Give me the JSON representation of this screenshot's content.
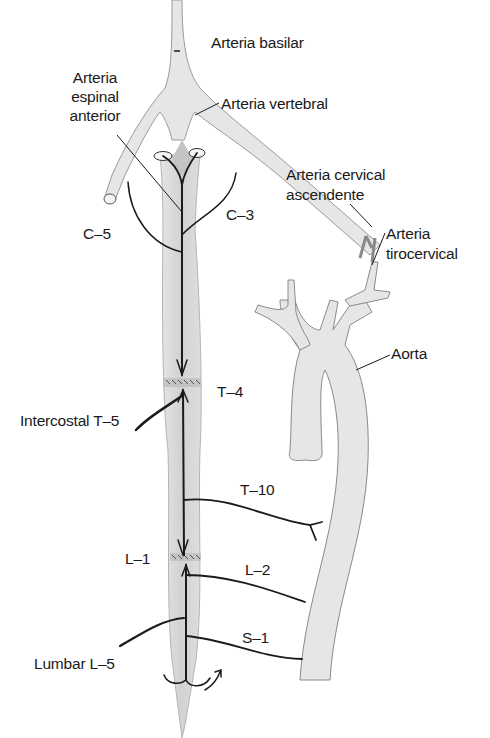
{
  "diagram": {
    "colors": {
      "vessel_fill": "#e4e4e4",
      "vessel_shade": "#cfcfcf",
      "cord_fill": "#d9d9d9",
      "line": "#1a1a1a",
      "background": "#ffffff"
    },
    "labels": {
      "basilar": "Arteria basilar",
      "espinal_1": "Arteria",
      "espinal_2": "espinal",
      "espinal_3": "anterior",
      "vertebral": "Arteria vertebral",
      "cervical_asc_1": "Arteria cervical",
      "cervical_asc_2": "ascendente",
      "tirocervical_1": "Arteria",
      "tirocervical_2": "tirocervical",
      "c5": "C–5",
      "c3": "C–3",
      "aorta": "Aorta",
      "t4": "T–4",
      "intercostal_t5": "Intercostal T–5",
      "t10": "T–10",
      "l1": "L–1",
      "l2": "L–2",
      "s1": "S–1",
      "lumbar_l5": "Lumbar L–5"
    }
  }
}
